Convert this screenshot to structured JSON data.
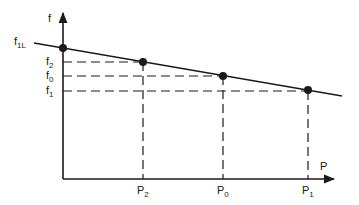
{
  "diagram": {
    "axes": {
      "y_label": "f",
      "x_label": "P"
    },
    "line_label": {
      "base": "f",
      "sub": "1L"
    },
    "y_labels": [
      {
        "base": "f",
        "sub": "2",
        "y": 62
      },
      {
        "base": "f",
        "sub": "0",
        "y": 76
      },
      {
        "base": "f",
        "sub": "1",
        "y": 91
      }
    ],
    "x_labels": [
      {
        "base": "P",
        "sub": "2",
        "x": 143
      },
      {
        "base": "P",
        "sub": "0",
        "x": 223
      },
      {
        "base": "P",
        "sub": "1",
        "x": 308
      }
    ],
    "points": [
      {
        "name": "f1L-intercept",
        "x": 63,
        "y": 48
      },
      {
        "name": "point-P2-f2",
        "x": 143,
        "y": 62
      },
      {
        "name": "point-P0-f0",
        "x": 223,
        "y": 76
      },
      {
        "name": "point-P1-f1",
        "x": 308,
        "y": 91
      }
    ],
    "colors": {
      "ink": "#1a1a1a",
      "background": "#ffffff"
    }
  }
}
